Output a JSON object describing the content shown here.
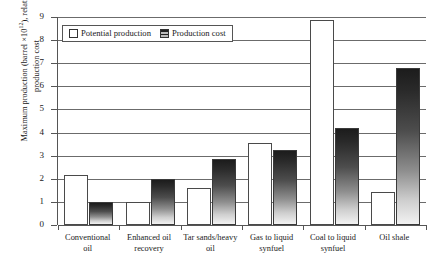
{
  "top_bleed_text": "            ",
  "legend": {
    "items": [
      {
        "label": "Potential production",
        "swatch": "white-square-swatch"
      },
      {
        "label": "Production cost",
        "swatch": "hatched-square-swatch"
      }
    ]
  },
  "axes": {
    "y_title_line1": "Maximum production (barrel ×10",
    "y_title_sup": "12",
    "y_title_line2": "), relative",
    "y_title_line3": "production cost",
    "y_title_full": "Maximum production (barrel ×10¹²), relative production cost",
    "y_ticks": [
      "9",
      "8",
      "7",
      "6",
      "5",
      "4",
      "3",
      "2",
      "1",
      "0"
    ],
    "x_title": ""
  },
  "chart_data": {
    "type": "bar",
    "title": "",
    "subtitle": "",
    "xlabel": "",
    "ylabel": "Maximum production (barrel ×10¹²), relative production cost",
    "ylim": [
      0,
      9
    ],
    "ytick_step": 1,
    "grid": true,
    "legend_position": "top-left-inside",
    "categories": [
      "Conventional oil",
      "Enhanced oil recovery",
      "Tar sands/heavy oil",
      "Gas to liquid synfuel",
      "Coal to liquid synfuel",
      "Oil shale"
    ],
    "category_lines": [
      [
        "Conventional",
        "oil"
      ],
      [
        "Enhanced oil",
        "recovery"
      ],
      [
        "Tar sands/heavy",
        "oil"
      ],
      [
        "Gas to liquid",
        "synfuel"
      ],
      [
        "Coal to liquid",
        "synfuel"
      ],
      [
        "Oil shale"
      ]
    ],
    "series": [
      {
        "name": "Potential production",
        "color": "#ffffff",
        "values": [
          2.15,
          1.0,
          1.6,
          3.55,
          8.85,
          1.45
        ]
      },
      {
        "name": "Production cost",
        "color": "#2a2a2a",
        "values": [
          1.0,
          2.0,
          2.85,
          3.25,
          4.2,
          6.8
        ]
      }
    ]
  }
}
